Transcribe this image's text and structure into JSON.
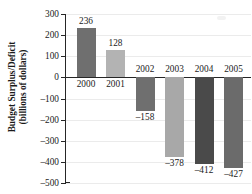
{
  "chart_data": {
    "type": "bar",
    "title": "",
    "xlabel": "",
    "ylabel_line1": "Budget Surplus/Deficit",
    "ylabel_line2": "(billions of dollars)",
    "categories": [
      "2000",
      "2001",
      "2002",
      "2003",
      "2004",
      "2005"
    ],
    "values": [
      236,
      128,
      -158,
      -378,
      -412,
      -427
    ],
    "value_labels": [
      "236",
      "128",
      "–158",
      "–378",
      "–412",
      "–427"
    ],
    "bar_colors": [
      "#6f6f6f",
      "#b3b3b3",
      "#6f6f6f",
      "#a8a8a8",
      "#4a4a4a",
      "#6b6b6b"
    ],
    "ylim": [
      -500,
      300
    ],
    "ytick_values": [
      300,
      200,
      100,
      0,
      -100,
      -200,
      -300,
      -400,
      -500
    ],
    "ytick_labels": [
      "300",
      "200",
      "100",
      "0",
      "–100",
      "–200",
      "–300",
      "–400",
      "–500"
    ],
    "grid": true,
    "legend": "none",
    "zero_line": 0
  },
  "axis_colors": {
    "spine": "#262626",
    "grid": "#ebebeb",
    "text": "#1a1a1a"
  }
}
